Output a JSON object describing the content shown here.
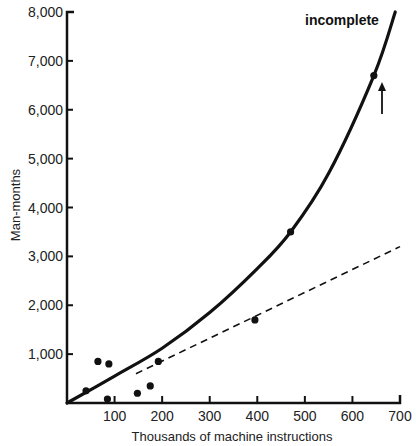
{
  "chart_data": {
    "type": "scatter",
    "title": "",
    "xlabel": "Thousands of machine instructions",
    "ylabel": "Man-months",
    "xlim": [
      0,
      700
    ],
    "ylim": [
      0,
      8000
    ],
    "x_ticks": [
      100,
      200,
      300,
      400,
      500,
      600,
      700
    ],
    "x_tick_labels": [
      "100",
      "200",
      "300",
      "400",
      "500",
      "600",
      "700"
    ],
    "y_ticks": [
      1000,
      2000,
      3000,
      4000,
      5000,
      6000,
      7000,
      8000
    ],
    "y_tick_labels": [
      "1,000",
      "2,000",
      "3,000",
      "4,000",
      "5,000",
      "6,000",
      "7,000",
      "8,000"
    ],
    "grid": false,
    "series": [
      {
        "name": "Projects",
        "type": "scatter",
        "points": [
          {
            "x": 40,
            "y": 250
          },
          {
            "x": 65,
            "y": 850
          },
          {
            "x": 88,
            "y": 800
          },
          {
            "x": 85,
            "y": 80
          },
          {
            "x": 148,
            "y": 200
          },
          {
            "x": 175,
            "y": 350
          },
          {
            "x": 192,
            "y": 850
          },
          {
            "x": 395,
            "y": 1700
          },
          {
            "x": 470,
            "y": 3500
          },
          {
            "x": 645,
            "y": 6700
          }
        ]
      },
      {
        "name": "Fitted curve",
        "type": "line",
        "style": "solid",
        "points": [
          {
            "x": 0,
            "y": 0
          },
          {
            "x": 100,
            "y": 550
          },
          {
            "x": 200,
            "y": 1120
          },
          {
            "x": 300,
            "y": 1850
          },
          {
            "x": 400,
            "y": 2750
          },
          {
            "x": 470,
            "y": 3500
          },
          {
            "x": 550,
            "y": 4700
          },
          {
            "x": 645,
            "y": 6700
          },
          {
            "x": 690,
            "y": 8000
          }
        ]
      },
      {
        "name": "Linear trend",
        "type": "line",
        "style": "dashed",
        "points": [
          {
            "x": 145,
            "y": 600
          },
          {
            "x": 700,
            "y": 3200
          }
        ]
      }
    ],
    "annotations": [
      {
        "text": "incomplete",
        "x": 545,
        "y": 7700
      },
      {
        "text": "arrow-up",
        "x": 665,
        "y": 5000
      }
    ]
  },
  "labels": {
    "incomplete": "incomplete",
    "xlabel": "Thousands of machine instructions",
    "ylabel": "Man-months"
  }
}
